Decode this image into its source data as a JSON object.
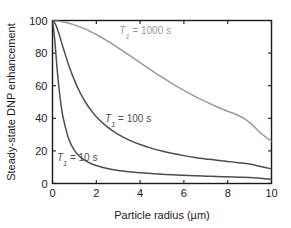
{
  "chart_data": {
    "type": "line",
    "title": "",
    "xlabel": "Particle radius (µm)",
    "ylabel": "Steady-state DNP enhancement",
    "xlim": [
      0,
      10
    ],
    "ylim": [
      0,
      100
    ],
    "xticks": [
      0,
      2,
      4,
      6,
      8,
      10
    ],
    "yticks": [
      0,
      20,
      40,
      60,
      80,
      100
    ],
    "xtick_labels": [
      "0",
      "2",
      "4",
      "6",
      "8",
      "10"
    ],
    "ytick_labels": [
      "0",
      "20",
      "40",
      "60",
      "80",
      "100"
    ],
    "grid": false,
    "legend_position": "inline-annotations",
    "x": [
      0,
      0.1,
      0.2,
      0.3,
      0.4,
      0.5,
      0.75,
      1,
      1.25,
      1.5,
      1.75,
      2,
      2.5,
      3,
      3.5,
      4,
      4.5,
      5,
      5.5,
      6,
      6.5,
      7,
      7.5,
      8,
      8.5,
      9,
      9.5,
      10
    ],
    "series": [
      {
        "name": "T1 = 1000 s",
        "label_text": "T₁ = 1000 s",
        "label_prefix": "T",
        "label_subscript": "1",
        "label_suffix": " = 1000 s",
        "color": "#9a9a9a",
        "label_x": 3.05,
        "label_y": 92,
        "values": [
          100,
          99.9,
          99.8,
          99.6,
          99.4,
          99.1,
          98.3,
          97.3,
          96.1,
          94.7,
          93.1,
          91.4,
          87.5,
          83.2,
          78.7,
          74.1,
          69.6,
          65.2,
          61.0,
          57.1,
          53.5,
          50.2,
          47.1,
          44.3,
          41.7,
          37.5,
          31.0,
          26.0
        ]
      },
      {
        "name": "T1 = 100 s",
        "label_text": "T₁ = 100 s",
        "label_prefix": "T",
        "label_subscript": "1",
        "label_suffix": " = 100 s",
        "color": "#4d4d4d",
        "label_x": 2.4,
        "label_y": 38,
        "values": [
          100,
          98.6,
          95.6,
          91.6,
          87.2,
          82.7,
          72.3,
          63.4,
          56.0,
          50.0,
          45.1,
          41.0,
          34.7,
          30.1,
          26.6,
          23.9,
          21.7,
          19.9,
          18.4,
          17.1,
          16.0,
          15.1,
          14.2,
          13.5,
          12.8,
          12.0,
          10.4,
          9.0
        ]
      },
      {
        "name": "T1 = 10 s",
        "label_text": "T₁ = 10 s",
        "label_prefix": "T",
        "label_subscript": "1",
        "label_suffix": " = 10 s",
        "color": "#4d4d4d",
        "label_x": 0.2,
        "label_y": 13.5,
        "values": [
          100,
          88.5,
          72.0,
          58.0,
          47.4,
          39.5,
          27.0,
          20.3,
          16.5,
          14.0,
          12.3,
          11.0,
          9.2,
          8.0,
          7.2,
          6.6,
          6.1,
          5.7,
          5.3,
          5.0,
          4.7,
          4.5,
          4.3,
          4.1,
          3.9,
          3.7,
          3.2,
          2.6
        ]
      }
    ]
  },
  "axis": {
    "frame_color": "#1a1a1a",
    "background": "#ffffff"
  }
}
